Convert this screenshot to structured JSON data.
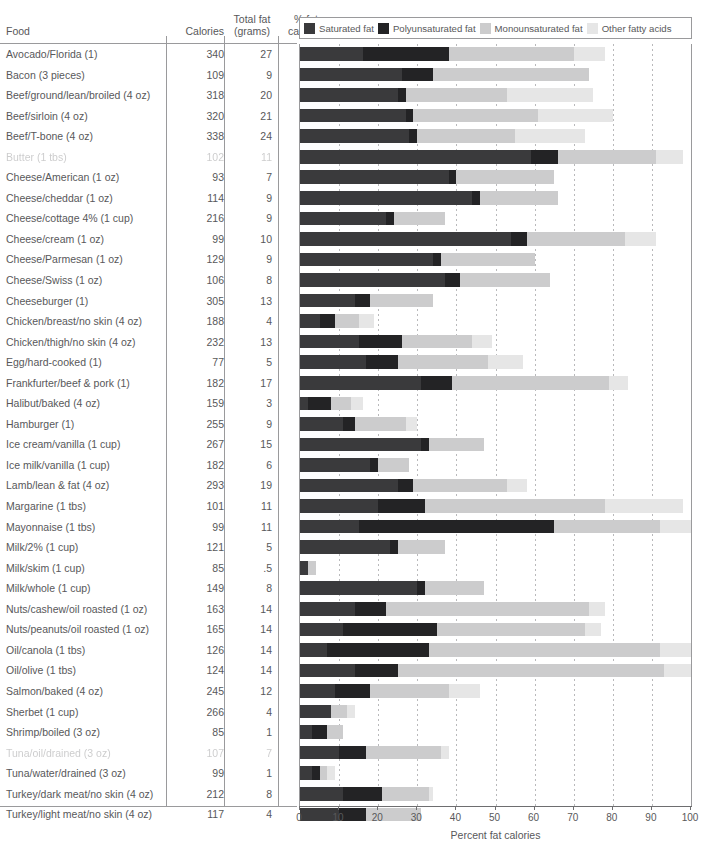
{
  "header": {
    "food": "Food",
    "calories": "Calories",
    "total_fat_line1": "Total fat",
    "total_fat_line2": "(grams)",
    "pct_fat_line1": "% fat",
    "pct_fat_line2": "calories"
  },
  "legend": {
    "items": [
      {
        "label": "Saturated fat",
        "color": "#3a3a3c"
      },
      {
        "label": "Polyunsaturated fat",
        "color": "#232325"
      },
      {
        "label": "Monounsaturated fat",
        "color": "#cccccd"
      },
      {
        "label": "Other fatty acids",
        "color": "#e6e6e6"
      }
    ]
  },
  "chart_data": {
    "type": "bar",
    "orientation": "horizontal",
    "stacked": true,
    "title": "",
    "xlabel": "Percent fat calories",
    "ylabel": "",
    "xlim": [
      0,
      100
    ],
    "xticks": [
      0,
      10,
      20,
      30,
      40,
      50,
      60,
      70,
      80,
      90,
      100
    ],
    "grid": "vertical-dashed",
    "legend_position": "top",
    "series": [
      {
        "name": "Saturated fat",
        "color": "#3a3a3c"
      },
      {
        "name": "Polyunsaturated fat",
        "color": "#232325"
      },
      {
        "name": "Monounsaturated fat",
        "color": "#cccccd"
      },
      {
        "name": "Other fatty acids",
        "color": "#e6e6e6"
      }
    ],
    "columns": [
      "Food",
      "Calories",
      "Total fat (grams)",
      "% fat calories"
    ],
    "rows": [
      {
        "food": "Avocado/Florida (1)",
        "calories": "340",
        "fat": "27",
        "pct": "71.5",
        "segments": [
          16,
          22,
          32,
          8
        ],
        "degraded": false
      },
      {
        "food": "Bacon (3 pieces)",
        "calories": "109",
        "fat": "9",
        "pct": "74.3",
        "segments": [
          26,
          8,
          40,
          0
        ],
        "degraded": false
      },
      {
        "food": "Beef/ground/lean/broiled (4 oz)",
        "calories": "318",
        "fat": "20",
        "pct": "56.6",
        "segments": [
          25,
          2,
          26,
          22
        ],
        "degraded": false
      },
      {
        "food": "Beef/sirloin (4 oz)",
        "calories": "320",
        "fat": "21",
        "pct": "59.1",
        "segments": [
          27,
          2,
          32,
          19
        ],
        "degraded": false
      },
      {
        "food": "Beef/T-bone (4 oz)",
        "calories": "338",
        "fat": "24",
        "pct": "63.9",
        "segments": [
          28,
          2,
          25,
          18
        ],
        "degraded": false
      },
      {
        "food": "Butter (1 tbs)",
        "calories": "102",
        "fat": "11",
        "pct": "97.1",
        "segments": [
          59,
          7,
          25,
          7
        ],
        "degraded": true
      },
      {
        "food": "Cheese/American (1 oz)",
        "calories": "93",
        "fat": "7",
        "pct": "67.7",
        "segments": [
          38,
          2,
          25,
          0
        ],
        "degraded": false
      },
      {
        "food": "Cheese/cheddar (1 oz)",
        "calories": "114",
        "fat": "9",
        "pct": "71.1",
        "segments": [
          44,
          2,
          20,
          0
        ],
        "degraded": false
      },
      {
        "food": "Cheese/cottage 4% (1 cup)",
        "calories": "216",
        "fat": "9",
        "pct": "37.5",
        "segments": [
          22,
          2,
          13,
          0
        ],
        "degraded": false
      },
      {
        "food": "Cheese/cream (1 oz)",
        "calories": "99",
        "fat": "10",
        "pct": "90.9",
        "segments": [
          54,
          4,
          25,
          8
        ],
        "degraded": false
      },
      {
        "food": "Cheese/Parmesan (1 oz)",
        "calories": "129",
        "fat": "9",
        "pct": "62.8",
        "segments": [
          34,
          2,
          24,
          0
        ],
        "degraded": false
      },
      {
        "food": "Cheese/Swiss (1 oz)",
        "calories": "106",
        "fat": "8",
        "pct": "67.9",
        "segments": [
          37,
          4,
          23,
          0
        ],
        "degraded": false
      },
      {
        "food": "Cheeseburger (1)",
        "calories": "305",
        "fat": "13",
        "pct": "38.4",
        "segments": [
          14,
          4,
          16,
          0
        ],
        "degraded": false
      },
      {
        "food": "Chicken/breast/no skin (4 oz)",
        "calories": "188",
        "fat": "4",
        "pct": "19.1",
        "segments": [
          5,
          4,
          6,
          4
        ],
        "degraded": false
      },
      {
        "food": "Chicken/thigh/no skin (4 oz)",
        "calories": "232",
        "fat": "13",
        "pct": "50.4",
        "segments": [
          15,
          11,
          18,
          5
        ],
        "degraded": false
      },
      {
        "food": "Egg/hard-cooked (1)",
        "calories": "77",
        "fat": "5",
        "pct": "58.4",
        "segments": [
          17,
          8,
          23,
          9
        ],
        "degraded": false
      },
      {
        "food": "Frankfurter/beef & pork (1)",
        "calories": "182",
        "fat": "17",
        "pct": "84.1",
        "segments": [
          31,
          8,
          40,
          5
        ],
        "degraded": false
      },
      {
        "food": "Halibut/baked (4 oz)",
        "calories": "159",
        "fat": "3",
        "pct": "17.0",
        "segments": [
          2,
          6,
          5,
          3
        ],
        "degraded": false
      },
      {
        "food": "Hamburger (1)",
        "calories": "255",
        "fat": "9",
        "pct": "31.8",
        "segments": [
          11,
          3,
          13,
          3
        ],
        "degraded": false
      },
      {
        "food": "Ice cream/vanilla (1 cup)",
        "calories": "267",
        "fat": "15",
        "pct": "50.6",
        "segments": [
          31,
          2,
          14,
          0
        ],
        "degraded": false
      },
      {
        "food": "Ice milk/vanilla (1 cup)",
        "calories": "182",
        "fat": "6",
        "pct": "29.7",
        "segments": [
          18,
          2,
          8,
          0
        ],
        "degraded": false
      },
      {
        "food": "Lamb/lean & fat (4 oz)",
        "calories": "293",
        "fat": "19",
        "pct": "58.4",
        "segments": [
          25,
          4,
          24,
          5
        ],
        "degraded": false
      },
      {
        "food": "Margarine (1 tbs)",
        "calories": "101",
        "fat": "11",
        "pct": "98.0",
        "segments": [
          20,
          12,
          46,
          20
        ],
        "degraded": false
      },
      {
        "food": "Mayonnaise (1 tbs)",
        "calories": "99",
        "fat": "11",
        "pct": "100.0",
        "segments": [
          15,
          50,
          27,
          8
        ],
        "degraded": false
      },
      {
        "food": "Milk/2% (1 cup)",
        "calories": "121",
        "fat": "5",
        "pct": "37.2",
        "segments": [
          23,
          2,
          12,
          0
        ],
        "degraded": false
      },
      {
        "food": "Milk/skim (1 cup)",
        "calories": "85",
        "fat": ".5",
        "pct": "5.3",
        "segments": [
          2,
          0,
          2,
          0
        ],
        "degraded": false
      },
      {
        "food": "Milk/whole (1 cup)",
        "calories": "149",
        "fat": "8",
        "pct": "48.3",
        "segments": [
          30,
          2,
          15,
          0
        ],
        "degraded": false
      },
      {
        "food": "Nuts/cashew/oil roasted (1 oz)",
        "calories": "163",
        "fat": "14",
        "pct": "77.3",
        "segments": [
          14,
          8,
          52,
          4
        ],
        "degraded": false
      },
      {
        "food": "Nuts/peanuts/oil roasted (1 oz)",
        "calories": "165",
        "fat": "14",
        "pct": "76.4",
        "segments": [
          11,
          24,
          38,
          4
        ],
        "degraded": false
      },
      {
        "food": "Oil/canola (1 tbs)",
        "calories": "126",
        "fat": "14",
        "pct": "100.0",
        "segments": [
          7,
          26,
          59,
          8
        ],
        "degraded": false
      },
      {
        "food": "Oil/olive (1 tbs)",
        "calories": "124",
        "fat": "14",
        "pct": "100.0",
        "segments": [
          14,
          11,
          68,
          7
        ],
        "degraded": false
      },
      {
        "food": "Salmon/baked (4 oz)",
        "calories": "245",
        "fat": "12",
        "pct": "44.1",
        "segments": [
          9,
          9,
          20,
          8
        ],
        "degraded": false
      },
      {
        "food": "Sherbet (1 cup)",
        "calories": "266",
        "fat": "4",
        "pct": "13.5",
        "segments": [
          8,
          0,
          4,
          2
        ],
        "degraded": false
      },
      {
        "food": "Shrimp/boiled (3 oz)",
        "calories": "85",
        "fat": "1",
        "pct": "10.6",
        "segments": [
          3,
          4,
          4,
          0
        ],
        "degraded": false
      },
      {
        "food": "Tuna/oil/drained (3 oz)",
        "calories": "107",
        "fat": "7",
        "pct": "37.7",
        "segments": [
          10,
          7,
          19,
          2
        ],
        "degraded": true
      },
      {
        "food": "Tuna/water/drained (3 oz)",
        "calories": "99",
        "fat": "1",
        "pct": "9.1",
        "segments": [
          3,
          2,
          2,
          2
        ],
        "degraded": false
      },
      {
        "food": "Turkey/dark meat/no skin (4 oz)",
        "calories": "212",
        "fat": "8",
        "pct": "34.0",
        "segments": [
          11,
          10,
          12,
          1
        ],
        "degraded": false
      },
      {
        "food": "Turkey/light meat/no skin (4 oz)",
        "calories": "117",
        "fat": "4",
        "pct": "30.8",
        "segments": [
          10,
          7,
          14,
          0
        ],
        "degraded": false
      }
    ]
  }
}
